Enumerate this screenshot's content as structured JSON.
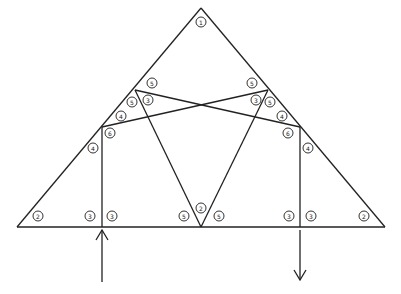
{
  "diagram": {
    "type": "roof-truss",
    "members": [
      {
        "id": "top-left",
        "x1": 17,
        "y1": 227,
        "x2": 201,
        "y2": 8
      },
      {
        "id": "top-right",
        "x1": 201,
        "y1": 8,
        "x2": 385,
        "y2": 227
      },
      {
        "id": "bottom-chord",
        "x1": 17,
        "y1": 227,
        "x2": 385,
        "y2": 227
      },
      {
        "id": "diag-left-up",
        "x1": 102,
        "y1": 127,
        "x2": 268,
        "y2": 90
      },
      {
        "id": "diag-right-up",
        "x1": 300,
        "y1": 127,
        "x2": 135,
        "y2": 90
      },
      {
        "id": "web-left",
        "x1": 135,
        "y1": 90,
        "x2": 201,
        "y2": 227
      },
      {
        "id": "web-right",
        "x1": 268,
        "y1": 90,
        "x2": 201,
        "y2": 227
      },
      {
        "id": "vert-left",
        "x1": 102,
        "y1": 127,
        "x2": 102,
        "y2": 227
      },
      {
        "id": "vert-right",
        "x1": 300,
        "y1": 127,
        "x2": 300,
        "y2": 227
      }
    ],
    "labels": [
      {
        "x": 201,
        "y": 22,
        "text": "1"
      },
      {
        "x": 38,
        "y": 216,
        "text": "2"
      },
      {
        "x": 364,
        "y": 216,
        "text": "2"
      },
      {
        "x": 201,
        "y": 208,
        "text": "2"
      },
      {
        "x": 90,
        "y": 216,
        "text": "3"
      },
      {
        "x": 112,
        "y": 216,
        "text": "3"
      },
      {
        "x": 289,
        "y": 216,
        "text": "3"
      },
      {
        "x": 311,
        "y": 216,
        "text": "3"
      },
      {
        "x": 148,
        "y": 100,
        "text": "3"
      },
      {
        "x": 256,
        "y": 100,
        "text": "3"
      },
      {
        "x": 93,
        "y": 148,
        "text": "4"
      },
      {
        "x": 308,
        "y": 148,
        "text": "4"
      },
      {
        "x": 121,
        "y": 116,
        "text": "4"
      },
      {
        "x": 282,
        "y": 116,
        "text": "4"
      },
      {
        "x": 152,
        "y": 83,
        "text": "5"
      },
      {
        "x": 252,
        "y": 83,
        "text": "5"
      },
      {
        "x": 132,
        "y": 102,
        "text": "5"
      },
      {
        "x": 270,
        "y": 102,
        "text": "5"
      },
      {
        "x": 184,
        "y": 216,
        "text": "5"
      },
      {
        "x": 219,
        "y": 216,
        "text": "5"
      },
      {
        "x": 110,
        "y": 133,
        "text": "6"
      },
      {
        "x": 288,
        "y": 133,
        "text": "6"
      }
    ],
    "arrows": [
      {
        "id": "reaction-up",
        "x": 102,
        "y_tail": 282,
        "y_head": 230,
        "direction": "up"
      },
      {
        "id": "load-down",
        "x": 300,
        "y_tail": 230,
        "y_head": 280,
        "direction": "down"
      }
    ]
  }
}
